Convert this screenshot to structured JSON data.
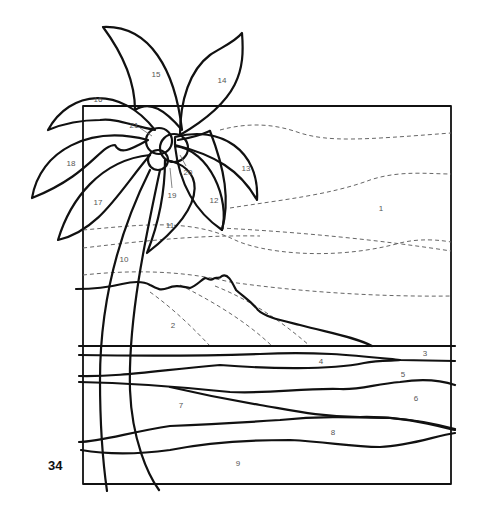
{
  "page": {
    "number": "34"
  },
  "colors": {
    "line": "#111111",
    "dashed": "#666666",
    "label": "#555555",
    "background": "#ffffff"
  },
  "pieces": [
    {
      "id": "1",
      "region": "sky",
      "x": 381,
      "y": 208
    },
    {
      "id": "2",
      "region": "mountain",
      "x": 173,
      "y": 325
    },
    {
      "id": "3",
      "region": "sea-far",
      "x": 425,
      "y": 353
    },
    {
      "id": "4",
      "region": "sea",
      "x": 321,
      "y": 361
    },
    {
      "id": "5",
      "region": "sea",
      "x": 403,
      "y": 374
    },
    {
      "id": "6",
      "region": "sea",
      "x": 416,
      "y": 398
    },
    {
      "id": "7",
      "region": "beach",
      "x": 181,
      "y": 405
    },
    {
      "id": "8",
      "region": "beach",
      "x": 333,
      "y": 432
    },
    {
      "id": "9",
      "region": "beach-foreground",
      "x": 238,
      "y": 463
    },
    {
      "id": "10",
      "region": "palm-trunk",
      "x": 124,
      "y": 259
    },
    {
      "id": "11",
      "region": "frond",
      "x": 170,
      "y": 225
    },
    {
      "id": "12",
      "region": "frond",
      "x": 214,
      "y": 200
    },
    {
      "id": "13",
      "region": "frond",
      "x": 246,
      "y": 168
    },
    {
      "id": "14",
      "region": "frond",
      "x": 222,
      "y": 80
    },
    {
      "id": "15",
      "region": "frond",
      "x": 156,
      "y": 74
    },
    {
      "id": "16",
      "region": "frond",
      "x": 98,
      "y": 99
    },
    {
      "id": "17",
      "region": "frond",
      "x": 98,
      "y": 202
    },
    {
      "id": "18",
      "region": "frond",
      "x": 71,
      "y": 163
    },
    {
      "id": "19",
      "region": "coconut",
      "x": 172,
      "y": 195
    },
    {
      "id": "20",
      "region": "coconut",
      "x": 188,
      "y": 172
    },
    {
      "id": "21",
      "region": "coconut",
      "x": 134,
      "y": 125
    }
  ]
}
